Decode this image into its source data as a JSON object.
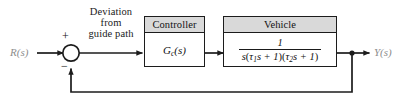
{
  "figure": {
    "type": "control-system-block-diagram",
    "background_color": "#ffffff",
    "line_color": "#1c1c1c",
    "header_fill": "#d9d9d9"
  },
  "signals": {
    "input_label": "R(s)",
    "output_label": "Y(s)"
  },
  "annotation": {
    "line1": "Deviation",
    "line2": "from",
    "line3": "guide path"
  },
  "summing_junction": {
    "name": "summing-junction",
    "plus_sign": "+",
    "minus_sign": "−"
  },
  "blocks": [
    {
      "id": "controller",
      "title": "Controller",
      "body_type": "symbol",
      "symbol_base": "G",
      "symbol_subscript": "c",
      "symbol_arg": "(s)",
      "body_text": "G_c(s)"
    },
    {
      "id": "vehicle",
      "title": "Vehicle",
      "body_type": "fraction",
      "numerator": "1",
      "denominator": "s(τ1s + 1)(τ2s + 1)",
      "denominator_parts": {
        "s": "s",
        "tau1": "τ",
        "sub1": "1",
        "mid": "s + 1",
        "tau2": "τ",
        "sub2": "2",
        "end": "s + 1"
      }
    }
  ],
  "feedback": {
    "name": "unity-feedback-path",
    "takeoff_label": "",
    "direction": "right-to-left"
  }
}
